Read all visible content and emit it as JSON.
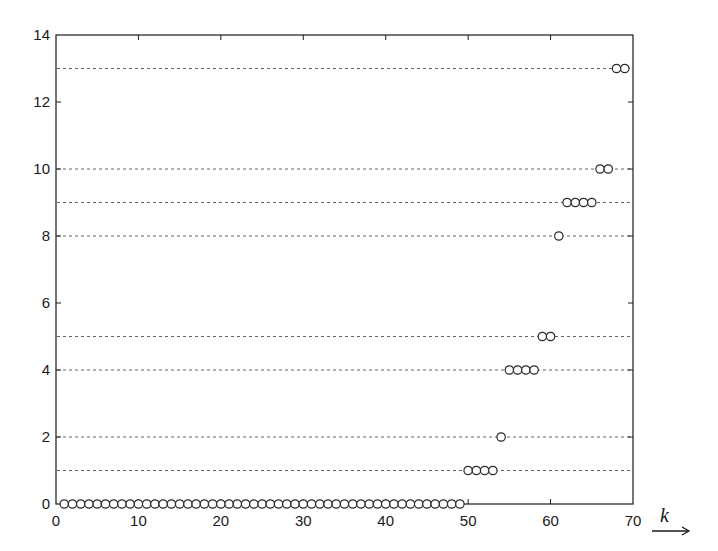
{
  "chart_data": {
    "type": "scatter",
    "title": "",
    "xlabel": "k",
    "ylabel": "",
    "xlim": [
      0,
      70
    ],
    "ylim": [
      0,
      14
    ],
    "xticks": [
      0,
      10,
      20,
      30,
      40,
      50,
      60,
      70
    ],
    "yticks": [
      0,
      2,
      4,
      6,
      8,
      10,
      12,
      14
    ],
    "grid": false,
    "legend": null,
    "marker": "open-circle",
    "reference_lines_y": [
      1,
      2,
      4,
      5,
      8,
      9,
      10,
      13
    ],
    "reference_line_style": "dotted",
    "series": [
      {
        "name": "values",
        "points": [
          {
            "k": 1,
            "y": 0
          },
          {
            "k": 2,
            "y": 0
          },
          {
            "k": 3,
            "y": 0
          },
          {
            "k": 4,
            "y": 0
          },
          {
            "k": 5,
            "y": 0
          },
          {
            "k": 6,
            "y": 0
          },
          {
            "k": 7,
            "y": 0
          },
          {
            "k": 8,
            "y": 0
          },
          {
            "k": 9,
            "y": 0
          },
          {
            "k": 10,
            "y": 0
          },
          {
            "k": 11,
            "y": 0
          },
          {
            "k": 12,
            "y": 0
          },
          {
            "k": 13,
            "y": 0
          },
          {
            "k": 14,
            "y": 0
          },
          {
            "k": 15,
            "y": 0
          },
          {
            "k": 16,
            "y": 0
          },
          {
            "k": 17,
            "y": 0
          },
          {
            "k": 18,
            "y": 0
          },
          {
            "k": 19,
            "y": 0
          },
          {
            "k": 20,
            "y": 0
          },
          {
            "k": 21,
            "y": 0
          },
          {
            "k": 22,
            "y": 0
          },
          {
            "k": 23,
            "y": 0
          },
          {
            "k": 24,
            "y": 0
          },
          {
            "k": 25,
            "y": 0
          },
          {
            "k": 26,
            "y": 0
          },
          {
            "k": 27,
            "y": 0
          },
          {
            "k": 28,
            "y": 0
          },
          {
            "k": 29,
            "y": 0
          },
          {
            "k": 30,
            "y": 0
          },
          {
            "k": 31,
            "y": 0
          },
          {
            "k": 32,
            "y": 0
          },
          {
            "k": 33,
            "y": 0
          },
          {
            "k": 34,
            "y": 0
          },
          {
            "k": 35,
            "y": 0
          },
          {
            "k": 36,
            "y": 0
          },
          {
            "k": 37,
            "y": 0
          },
          {
            "k": 38,
            "y": 0
          },
          {
            "k": 39,
            "y": 0
          },
          {
            "k": 40,
            "y": 0
          },
          {
            "k": 41,
            "y": 0
          },
          {
            "k": 42,
            "y": 0
          },
          {
            "k": 43,
            "y": 0
          },
          {
            "k": 44,
            "y": 0
          },
          {
            "k": 45,
            "y": 0
          },
          {
            "k": 46,
            "y": 0
          },
          {
            "k": 47,
            "y": 0
          },
          {
            "k": 48,
            "y": 0
          },
          {
            "k": 49,
            "y": 0
          },
          {
            "k": 50,
            "y": 1
          },
          {
            "k": 51,
            "y": 1
          },
          {
            "k": 52,
            "y": 1
          },
          {
            "k": 53,
            "y": 1
          },
          {
            "k": 54,
            "y": 2
          },
          {
            "k": 55,
            "y": 4
          },
          {
            "k": 56,
            "y": 4
          },
          {
            "k": 57,
            "y": 4
          },
          {
            "k": 58,
            "y": 4
          },
          {
            "k": 59,
            "y": 5
          },
          {
            "k": 60,
            "y": 5
          },
          {
            "k": 61,
            "y": 8
          },
          {
            "k": 62,
            "y": 9
          },
          {
            "k": 63,
            "y": 9
          },
          {
            "k": 64,
            "y": 9
          },
          {
            "k": 65,
            "y": 9
          },
          {
            "k": 66,
            "y": 10
          },
          {
            "k": 67,
            "y": 10
          },
          {
            "k": 68,
            "y": 13
          },
          {
            "k": 69,
            "y": 13
          }
        ]
      }
    ],
    "annotations": [
      {
        "text": "k",
        "style": "italic",
        "with_arrow": "right",
        "position": "right of x-axis"
      }
    ]
  },
  "colors": {
    "axis": "#1a1a1a",
    "marker": "#2a2a2a",
    "reference_line": "#555555",
    "background": "#ffffff"
  }
}
